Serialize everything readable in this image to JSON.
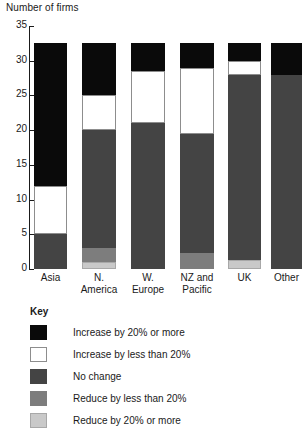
{
  "chart_data": {
    "type": "bar",
    "subtype": "stacked-bar",
    "title": "Number of firms",
    "xlabel": "",
    "ylabel": "Number of firms",
    "ylim": [
      0,
      35
    ],
    "yticks": [
      0,
      5,
      10,
      15,
      20,
      25,
      30,
      35
    ],
    "ytick_labels": [
      "0",
      "5",
      "10",
      "15",
      "20",
      "25",
      "30",
      "35"
    ],
    "grid": false,
    "legend_position": "below-plot",
    "legend_title": "Key",
    "categories": [
      "Asia",
      "N. America",
      "W. Europe",
      "NZ and Pacific",
      "UK",
      "Other"
    ],
    "category_lines": [
      [
        "Asia"
      ],
      [
        "N.",
        "America"
      ],
      [
        "W.",
        "Europe"
      ],
      [
        "NZ and",
        "Pacific"
      ],
      [
        "UK"
      ],
      [
        "Other"
      ]
    ],
    "series": [
      {
        "name": "Reduce by 20% or more",
        "key": "reduce_major",
        "color": "#c9c9c9",
        "values": [
          0,
          1.0,
          0,
          0,
          1.3,
          0
        ]
      },
      {
        "name": "Reduce by less than 20%",
        "key": "reduce_minor",
        "color": "#7d7d7d",
        "values": [
          0,
          2.0,
          0,
          2.3,
          0,
          0
        ]
      },
      {
        "name": "No change",
        "key": "no_change",
        "color": "#444444",
        "values": [
          5.0,
          17.0,
          21.0,
          17.2,
          26.7,
          28.0
        ]
      },
      {
        "name": "Increase by less than 20%",
        "key": "increase_minor",
        "color": "#ffffff",
        "values": [
          7.0,
          5.0,
          7.5,
          9.5,
          2.0,
          0
        ]
      },
      {
        "name": "Increase by 20% or more",
        "key": "increase_major",
        "color": "#0a0a0a",
        "values": [
          20.5,
          7.5,
          4.0,
          3.5,
          2.5,
          4.5
        ]
      }
    ],
    "totals": [
      32.5,
      32.5,
      32.5,
      32.5,
      32.5,
      32.5
    ]
  },
  "legend": {
    "title": "Key",
    "items": [
      {
        "label": "Increase by 20% or more",
        "color": "#0a0a0a",
        "swatch": "black-swatch"
      },
      {
        "label": "Increase by less than 20%",
        "color": "#ffffff",
        "swatch": "white-swatch"
      },
      {
        "label": "No change",
        "color": "#444444",
        "swatch": "dark-gray-swatch"
      },
      {
        "label": "Reduce by less than 20%",
        "color": "#7d7d7d",
        "swatch": "mid-gray-swatch"
      },
      {
        "label": "Reduce by 20% or more",
        "color": "#c9c9c9",
        "swatch": "light-gray-swatch"
      }
    ]
  }
}
